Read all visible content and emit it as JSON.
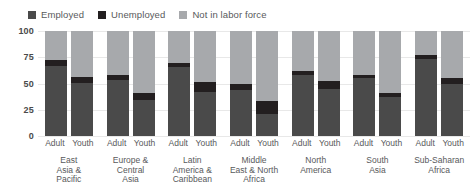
{
  "chart_data": {
    "type": "bar",
    "subtype": "stacked-grouped",
    "title": "",
    "xlabel": "",
    "ylabel": "",
    "ylim": [
      0,
      100
    ],
    "yticks": [
      0,
      25,
      50,
      75,
      100
    ],
    "ytick_labels": [
      "0",
      "25",
      "50",
      "75",
      "100"
    ],
    "grid": true,
    "legend_position": "top-left",
    "series": [
      {
        "name": "Employed",
        "color": "#4a4a4a"
      },
      {
        "name": "Unemployed",
        "color": "#231f20"
      },
      {
        "name": "Not in labor force",
        "color": "#a7a9ac"
      }
    ],
    "subcategories": [
      "Adult",
      "Youth"
    ],
    "categories": [
      "East\nAsia &\nPacific",
      "Europe &\nCentral\nAsia",
      "Latin\nAmerica &\nCaribbean",
      "Middle\nEast & North\nAfrica",
      "North\nAmerica",
      "South\nAsia",
      "Sub-Saharan\nAfrica"
    ],
    "groups": [
      {
        "category": "East\nAsia &\nPacific",
        "bars": [
          {
            "label": "Adult",
            "Employed": 67,
            "Unemployed": 5,
            "Not in labor force": 28
          },
          {
            "label": "Youth",
            "Employed": 50,
            "Unemployed": 6,
            "Not in labor force": 44
          }
        ]
      },
      {
        "category": "Europe &\nCentral\nAsia",
        "bars": [
          {
            "label": "Adult",
            "Employed": 53,
            "Unemployed": 5,
            "Not in labor force": 42
          },
          {
            "label": "Youth",
            "Employed": 34,
            "Unemployed": 7,
            "Not in labor force": 59
          }
        ]
      },
      {
        "category": "Latin\nAmerica &\nCaribbean",
        "bars": [
          {
            "label": "Adult",
            "Employed": 66,
            "Unemployed": 4,
            "Not in labor force": 30
          },
          {
            "label": "Youth",
            "Employed": 42,
            "Unemployed": 9,
            "Not in labor force": 49
          }
        ]
      },
      {
        "category": "Middle\nEast & North\nAfrica",
        "bars": [
          {
            "label": "Adult",
            "Employed": 44,
            "Unemployed": 6,
            "Not in labor force": 50
          },
          {
            "label": "Youth",
            "Employed": 21,
            "Unemployed": 12,
            "Not in labor force": 67
          }
        ]
      },
      {
        "category": "North\nAmerica",
        "bars": [
          {
            "label": "Adult",
            "Employed": 58,
            "Unemployed": 4,
            "Not in labor force": 38
          },
          {
            "label": "Youth",
            "Employed": 45,
            "Unemployed": 7,
            "Not in labor force": 48
          }
        ]
      },
      {
        "category": "South\nAsia",
        "bars": [
          {
            "label": "Adult",
            "Employed": 55,
            "Unemployed": 3,
            "Not in labor force": 42
          },
          {
            "label": "Youth",
            "Employed": 37,
            "Unemployed": 4,
            "Not in labor force": 59
          }
        ]
      },
      {
        "category": "Sub-Saharan\nAfrica",
        "bars": [
          {
            "label": "Adult",
            "Employed": 73,
            "Unemployed": 4,
            "Not in labor force": 23
          },
          {
            "label": "Youth",
            "Employed": 50,
            "Unemployed": 5,
            "Not in labor force": 45
          }
        ]
      }
    ]
  },
  "legend": {
    "items": [
      {
        "label": "Employed",
        "color": "#4a4a4a"
      },
      {
        "label": "Unemployed",
        "color": "#231f20"
      },
      {
        "label": "Not in labor force",
        "color": "#a7a9ac"
      }
    ]
  }
}
